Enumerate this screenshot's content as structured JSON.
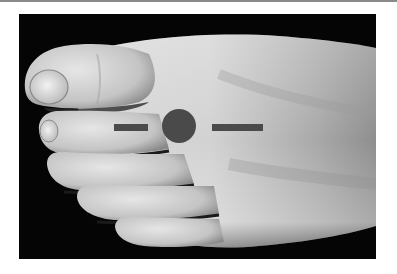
{
  "figure": {
    "background_color": "#050505",
    "page_color": "#ffffff",
    "top_rule_color": "#8a8a8a"
  },
  "marker": {
    "description": "Acupressure point marker between first and second toes on the dorsum of the foot",
    "color": "#4a4a4a",
    "left_bar": {
      "x": 114,
      "y": 124,
      "width": 34,
      "height": 7
    },
    "dot": {
      "cx": 179,
      "cy": 126,
      "r": 17
    },
    "right_bar": {
      "x": 212,
      "y": 124,
      "width": 51,
      "height": 7
    }
  },
  "icons": {
    "left_bar": "bar-marker-icon",
    "dot": "point-marker-icon",
    "right_bar": "bar-marker-icon"
  }
}
